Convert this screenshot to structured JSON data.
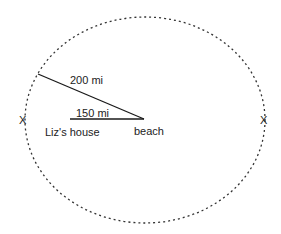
{
  "diagram": {
    "type": "geometry-distance-diagram",
    "ellipse": {
      "style": "dotted",
      "color": "#333333"
    },
    "labels": {
      "radius_label": "200 mi",
      "house_distance_label": "150 mi",
      "house_label": "Liz's house",
      "beach_label": "beach",
      "left_marker": "X",
      "right_marker": "X"
    },
    "colors": {
      "line": "#1a1a1a",
      "text": "#222222",
      "background": "#ffffff"
    }
  }
}
